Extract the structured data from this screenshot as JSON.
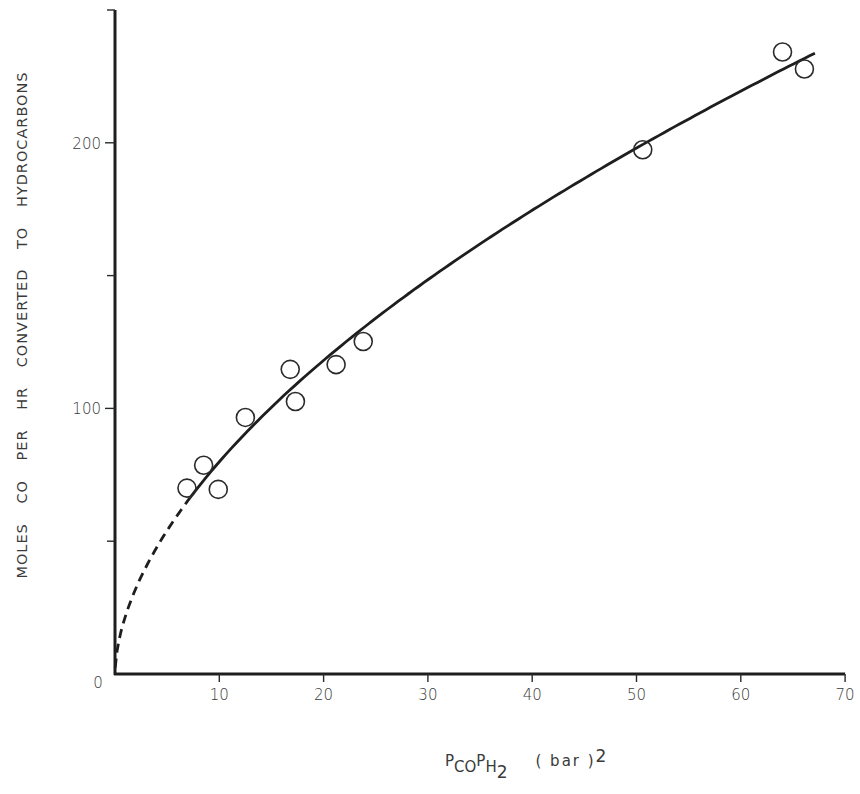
{
  "chart_data": {
    "type": "scatter",
    "title": "",
    "xlabel": "P_CO P_H2 (bar)^2",
    "ylabel": "MOLES CO PER HR CONVERTED TO HYDROCARBONS",
    "xlim": [
      0,
      70
    ],
    "ylim": [
      0,
      250
    ],
    "grid": false,
    "legend": null,
    "x_ticks": [
      0,
      10,
      20,
      30,
      40,
      50,
      60,
      70
    ],
    "x_tick_labels": [
      "",
      "10",
      "20",
      "30",
      "40",
      "50",
      "60",
      "70"
    ],
    "y_ticks_major": [
      0,
      100,
      200
    ],
    "y_tick_labels": [
      "0",
      "100",
      "200"
    ],
    "y_ticks_minor": [
      50,
      150,
      250
    ],
    "series": [
      {
        "name": "measured",
        "marker": "open-circle",
        "x": [
          6.9,
          8.5,
          9.9,
          12.5,
          16.8,
          17.3,
          21.2,
          23.8,
          50.6,
          64.0,
          66.1
        ],
        "y": [
          70,
          78.6,
          69.5,
          96.6,
          114.7,
          102.6,
          116.5,
          125.2,
          197.4,
          234.2,
          227.8
        ]
      },
      {
        "name": "fitted curve",
        "style": "line",
        "model": "y = 21.8 * x^0.564",
        "dashed_range": [
          0,
          7.2
        ],
        "solid_range": [
          7.2,
          67.1
        ]
      }
    ]
  },
  "axes": {
    "xlabel_parts": {
      "p1": "P",
      "s1": "CO",
      "p2": "P",
      "s2": "H",
      "s3": "2",
      "unit": "( bar )",
      "exp": "2"
    },
    "ylabel": "MOLES CO PER HR CONVERTED TO HYDROCARBONS"
  }
}
